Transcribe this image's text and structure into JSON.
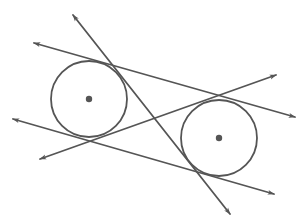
{
  "diagram": {
    "width": 305,
    "height": 223,
    "background": "#ffffff",
    "stroke_color": "#555555",
    "stroke_width": 1.8,
    "circles": [
      {
        "name": "left-circle",
        "cx": 89,
        "cy": 99,
        "r": 38,
        "center_dot_r": 3.2
      },
      {
        "name": "right-circle",
        "cx": 219,
        "cy": 138,
        "r": 38,
        "center_dot_r": 3.2
      }
    ],
    "lines": [
      {
        "name": "internal-tangent-steep",
        "x1": 73,
        "y1": 15,
        "x2": 230,
        "y2": 214,
        "arrows": "both"
      },
      {
        "name": "external-tangent-top",
        "x1": 34,
        "y1": 43,
        "x2": 295,
        "y2": 117,
        "arrows": "both"
      },
      {
        "name": "external-tangent-bottom",
        "x1": 13,
        "y1": 119,
        "x2": 274,
        "y2": 194,
        "arrows": "both"
      },
      {
        "name": "internal-tangent-shallow",
        "x1": 40,
        "y1": 159,
        "x2": 276,
        "y2": 75,
        "arrows": "both"
      }
    ]
  }
}
